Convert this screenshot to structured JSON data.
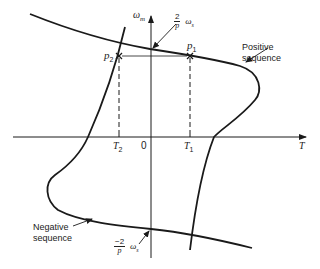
{
  "diagram": {
    "axes": {
      "x_label": "T",
      "y_label": "ω",
      "y_label_sub": "m",
      "origin_label": "0"
    },
    "ticks": {
      "t1": {
        "label": "T",
        "sub": "1"
      },
      "t2": {
        "label": "T",
        "sub": "2"
      }
    },
    "points": {
      "p1": {
        "label": "p",
        "sub": "1"
      },
      "p2": {
        "label": "p",
        "sub": "2"
      }
    },
    "annotations": {
      "pos_sync": {
        "num": "2",
        "den": "p",
        "omega": "ω",
        "omega_sub": "s"
      },
      "neg_sync": {
        "num": "−2",
        "den": "p",
        "omega": "ω",
        "omega_sub": "s"
      }
    },
    "curves": {
      "positive": {
        "line1": "Positive",
        "line2": "sequence"
      },
      "negative": {
        "line1": "Negative",
        "line2": "sequence"
      }
    },
    "colors": {
      "line": "#1a1a1a",
      "background": "#ffffff"
    }
  }
}
